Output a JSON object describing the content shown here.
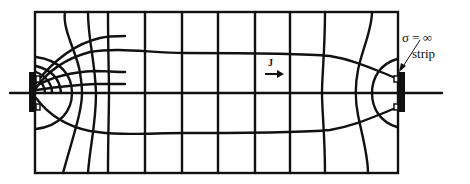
{
  "figure": {
    "labels": {
      "sigma": "σ = ∞",
      "strip": "strip",
      "current_density": "J"
    },
    "colors": {
      "line": "#111111",
      "background": "#ffffff"
    },
    "elements": {
      "conductor_rectangle": "rectangular conductor region",
      "left_electrode": "perfectly conducting strip (left)",
      "right_electrode": "perfectly conducting strip (right)",
      "axis": "horizontal symmetry axis",
      "current_lines": "curvilinear current flow lines",
      "equipotentials": "curvilinear equipotential lines",
      "arrow": "current direction arrow"
    }
  }
}
